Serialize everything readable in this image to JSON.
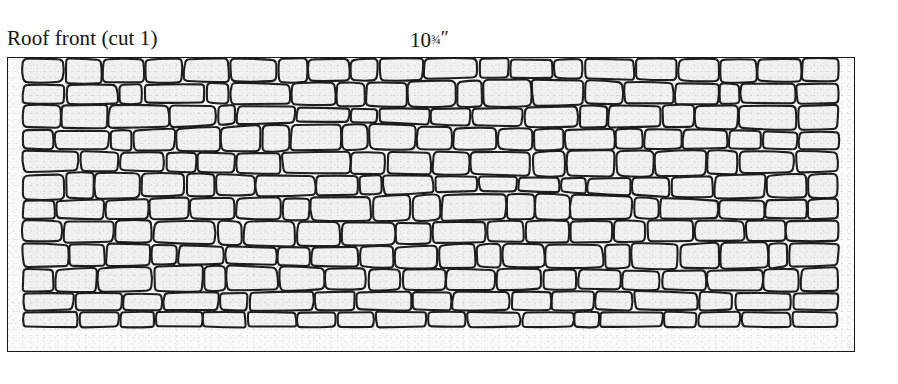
{
  "caption": {
    "title": "Roof front (cut 1)",
    "measure_whole": "10",
    "measure_fraction": "¾",
    "measure_unit": "″",
    "measure_full": "10¾″"
  },
  "panel": {
    "label": "stone-pattern-panel",
    "border_color": "#1a1a1a",
    "fill_color": "#fbfbfb"
  },
  "stone_pattern": {
    "type": "irregular-coursed-stonework",
    "stone_fill": "#f1f1f1",
    "stone_stroke": "#1c1c1c",
    "stroke_width": 2.1,
    "rows": 12,
    "margin_left": 14,
    "margin_right": 14,
    "margin_top": 0,
    "margin_bottom": 22,
    "row_boundaries": [
      0,
      24,
      48,
      70,
      94,
      118,
      140,
      164,
      188,
      212,
      236,
      256,
      273
    ],
    "row_waviness": [
      0,
      2,
      -2,
      3,
      -1,
      2,
      -3,
      1,
      2,
      -2,
      1,
      0,
      0
    ],
    "stones_per_row": [
      20,
      19,
      18,
      21,
      18,
      20,
      19,
      18,
      20,
      19,
      17,
      18
    ],
    "seed": 20240716
  }
}
